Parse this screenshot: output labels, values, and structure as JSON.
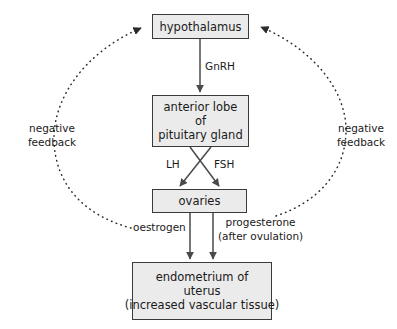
{
  "diagram": {
    "colors": {
      "box_fill": "#ebebeb",
      "box_stroke": "#3a3a3a",
      "arrow": "#4a4a4a",
      "dotted_arrow": "#2b2b2b",
      "text": "#1a1a1a",
      "background": "#ffffff"
    },
    "nodes": [
      {
        "id": "hypothalamus",
        "lines": [
          "hypothalamus"
        ]
      },
      {
        "id": "pituitary",
        "lines": [
          "anterior lobe",
          "of",
          "pituitary gland"
        ]
      },
      {
        "id": "ovaries",
        "lines": [
          "ovaries"
        ]
      },
      {
        "id": "endometrium",
        "lines": [
          "endometrium of",
          "uterus",
          "(increased vascular tissue)"
        ]
      }
    ],
    "edge_labels": {
      "gnrh": "GnRH",
      "lh": "LH",
      "fsh": "FSH",
      "oestrogen": "oestrogen",
      "progesterone_line1": "progesterone",
      "progesterone_line2": "(after ovulation)"
    },
    "feedback": {
      "left_line1": "negative",
      "left_line2": "feedback",
      "right_line1": "negative",
      "right_line2": "feedback"
    }
  }
}
